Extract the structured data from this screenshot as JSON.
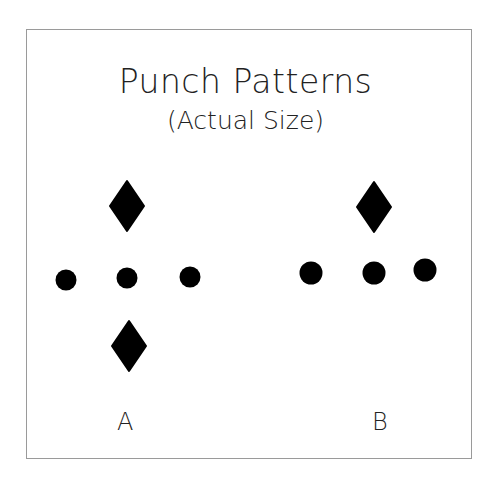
{
  "title": "Punch Patterns",
  "subtitle": "(Actual Size)",
  "patterns": [
    {
      "label": "A",
      "shapes": [
        {
          "type": "diamond",
          "cx": 127,
          "cy": 206
        },
        {
          "type": "circle",
          "cx": 66,
          "cy": 280
        },
        {
          "type": "circle",
          "cx": 127,
          "cy": 278
        },
        {
          "type": "circle",
          "cx": 190,
          "cy": 277
        },
        {
          "type": "diamond",
          "cx": 129,
          "cy": 346
        }
      ]
    },
    {
      "label": "B",
      "shapes": [
        {
          "type": "diamond",
          "cx": 374,
          "cy": 207
        },
        {
          "type": "circle",
          "cx": 311,
          "cy": 273
        },
        {
          "type": "circle",
          "cx": 374,
          "cy": 273
        },
        {
          "type": "circle",
          "cx": 425,
          "cy": 270
        }
      ]
    }
  ],
  "colors": {
    "ink": "#000000",
    "border": "#9a9a9a"
  }
}
